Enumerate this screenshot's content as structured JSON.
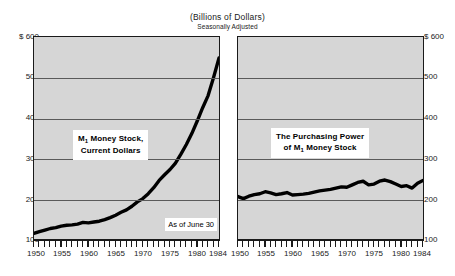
{
  "figure": {
    "title": "(Billions of Dollars)",
    "subtitle": "Seasonally Adjusted",
    "note": "As of June 30"
  },
  "axis": {
    "y_ticks": [
      "$ 600",
      "500",
      "400",
      "300",
      "200",
      "100"
    ],
    "y_left_labels": [
      "$ 600",
      "500",
      "400",
      "300",
      "200",
      "100"
    ],
    "y_right_labels": [
      "$ 600",
      "500",
      "400",
      "300",
      "200",
      "100"
    ],
    "x_ticks": [
      "1950",
      "1955",
      "1960",
      "1965",
      "1970",
      "1975",
      "1980",
      "1984"
    ]
  },
  "annotations": {
    "left_line1": "M",
    "left_sub1": "1",
    "left_line1b": " Money Stock,",
    "left_line2": "Current Dollars",
    "right_line1": "The Purchasing Power",
    "right_line2a": "of M",
    "right_sub2": "1",
    "right_line2b": " Money Stock"
  },
  "colors": {
    "panel_background": "#d6d6d6",
    "frame": "#1a1a1a",
    "gridline": "#5a5a5a",
    "series": "#000000",
    "page_background": "#ffffff"
  },
  "chart_data": [
    {
      "type": "line",
      "id": "m1-current-dollars",
      "title": "M1 Money Stock, Current Dollars",
      "subtitle": "(Billions of Dollars) Seasonally Adjusted",
      "xlabel": "",
      "ylabel": "Billions of Dollars",
      "xlim": [
        1950,
        1984
      ],
      "ylim": [
        100,
        600
      ],
      "yticks": [
        100,
        200,
        300,
        400,
        500,
        600
      ],
      "xticks": [
        1950,
        1955,
        1960,
        1965,
        1970,
        1975,
        1980,
        1984
      ],
      "grid": true,
      "legend": "none",
      "annotation": "As of June 30",
      "x": [
        1950,
        1951,
        1952,
        1953,
        1954,
        1955,
        1956,
        1957,
        1958,
        1959,
        1960,
        1961,
        1962,
        1963,
        1964,
        1965,
        1966,
        1967,
        1968,
        1969,
        1970,
        1971,
        1972,
        1973,
        1974,
        1975,
        1976,
        1977,
        1978,
        1979,
        1980,
        1981,
        1982,
        1983,
        1984
      ],
      "values": [
        114,
        118,
        122,
        126,
        128,
        132,
        134,
        135,
        137,
        141,
        140,
        142,
        144,
        148,
        153,
        159,
        166,
        172,
        181,
        192,
        200,
        212,
        227,
        245,
        259,
        272,
        288,
        310,
        334,
        361,
        392,
        425,
        455,
        500,
        548
      ]
    },
    {
      "type": "line",
      "id": "m1-purchasing-power",
      "title": "The Purchasing Power of M1 Money Stock",
      "subtitle": "(Billions of Dollars) Seasonally Adjusted",
      "xlabel": "",
      "ylabel": "Billions of Dollars",
      "xlim": [
        1950,
        1984
      ],
      "ylim": [
        100,
        600
      ],
      "yticks": [
        100,
        200,
        300,
        400,
        500,
        600
      ],
      "xticks": [
        1950,
        1955,
        1960,
        1965,
        1970,
        1975,
        1980,
        1984
      ],
      "grid": true,
      "legend": "none",
      "x": [
        1950,
        1951,
        1952,
        1953,
        1954,
        1955,
        1956,
        1957,
        1958,
        1959,
        1960,
        1961,
        1962,
        1963,
        1964,
        1965,
        1966,
        1967,
        1968,
        1969,
        1970,
        1971,
        1972,
        1973,
        1974,
        1975,
        1976,
        1977,
        1978,
        1979,
        1980,
        1981,
        1982,
        1983,
        1984
      ],
      "values": [
        205,
        200,
        206,
        210,
        212,
        217,
        214,
        210,
        212,
        215,
        209,
        210,
        211,
        213,
        216,
        219,
        221,
        223,
        226,
        229,
        228,
        234,
        240,
        243,
        234,
        236,
        243,
        246,
        242,
        236,
        230,
        232,
        226,
        238,
        245
      ]
    }
  ]
}
